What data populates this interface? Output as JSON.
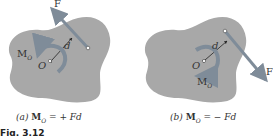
{
  "panels": [
    {
      "id": "a",
      "force_label": "F",
      "distance_label": "d",
      "moment_label": "M",
      "moment_sub": "O",
      "point_label": "O",
      "caption_prefix": "(a)",
      "caption_lhs": "M",
      "caption_lhs_sub": "O",
      "caption_rhs": " = + Fd"
    },
    {
      "id": "b",
      "force_label": "F",
      "distance_label": "d",
      "moment_label": "M",
      "moment_sub": "O",
      "point_label": "O",
      "caption_prefix": "(b)",
      "caption_lhs": "M",
      "caption_lhs_sub": "O",
      "caption_rhs": " = − Fd"
    }
  ],
  "figure_label": "Fig. 3.12",
  "colors": {
    "body_fill": "#a8a8a8",
    "arrow": "#7f8c99",
    "text": "#333333"
  }
}
